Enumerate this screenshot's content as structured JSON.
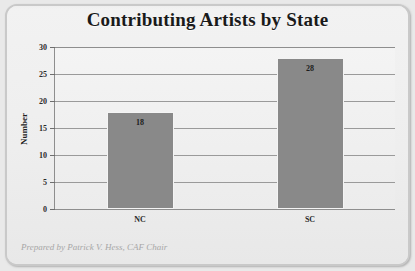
{
  "chart_data": {
    "type": "bar",
    "title": "Contributing Artists by State",
    "categories": [
      "NC",
      "SC"
    ],
    "values": [
      18,
      28
    ],
    "data_labels": [
      "18",
      "28"
    ],
    "xlabel": "",
    "ylabel": "Number",
    "ylim": [
      0,
      30
    ],
    "yticks": [
      0,
      5,
      10,
      15,
      20,
      25,
      30
    ],
    "ytick_labels": [
      "0",
      "5",
      "10",
      "15",
      "20",
      "25",
      "30"
    ],
    "grid": true,
    "legend": false,
    "bar_color": "#898989",
    "footnote": "Prepared by Patrick V. Hess, CAF Chair"
  },
  "colors": {
    "title_text": "#1a1a1a",
    "bar_fill": "#898989",
    "plot_background": "#f0f0f0",
    "card_background": "#efefef",
    "frame_border": "#c9c9c9",
    "gridline": "#9a9a9a",
    "axis_line": "#8e8e8e",
    "footnote_text": "#a7a7a7"
  }
}
